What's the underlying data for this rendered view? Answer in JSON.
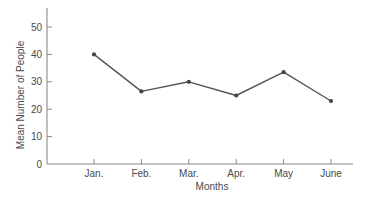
{
  "chart_data": {
    "type": "line",
    "title": "",
    "xlabel": "Months",
    "ylabel": "Mean Number of People",
    "categories": [
      "Jan.",
      "Feb.",
      "Mar.",
      "Apr.",
      "May",
      "June"
    ],
    "values": [
      40,
      26.5,
      30,
      25,
      33.5,
      23
    ],
    "ylim": [
      0,
      57
    ],
    "yticks": [
      0,
      10,
      20,
      30,
      40,
      50
    ],
    "grid": false,
    "legend": null,
    "colors": {
      "line": "#555555",
      "axis": "#8a8a8a",
      "text": "#4a4a4a"
    }
  }
}
